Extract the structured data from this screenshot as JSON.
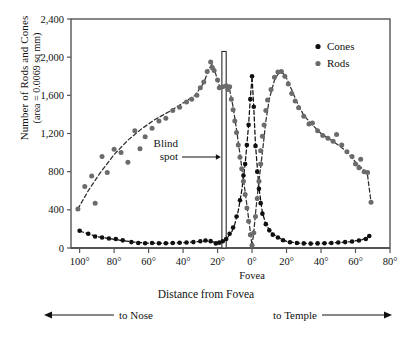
{
  "chart_data": {
    "type": "scatter",
    "title": "",
    "xlabel": "Distance from Fovea",
    "ylabel_line1": "Number of Rods and Cones",
    "ylabel_line2": "(area = 0.0069 sq mm)",
    "xlim": [
      -105,
      80
    ],
    "ylim": [
      0,
      2400
    ],
    "grid": false,
    "legend_position": "top-right",
    "x_ticks": [
      {
        "value": -100,
        "label": "100°"
      },
      {
        "value": -80,
        "label": "80°"
      },
      {
        "value": -60,
        "label": "60°"
      },
      {
        "value": -40,
        "label": "40°"
      },
      {
        "value": -20,
        "label": "20°"
      },
      {
        "value": 0,
        "label": "0°"
      },
      {
        "value": 20,
        "label": "20°"
      },
      {
        "value": 40,
        "label": "40°"
      },
      {
        "value": 60,
        "label": "60°"
      },
      {
        "value": 80,
        "label": "80°"
      }
    ],
    "y_ticks": [
      {
        "value": 0,
        "label": "0"
      },
      {
        "value": 400,
        "label": "400"
      },
      {
        "value": 800,
        "label": "800"
      },
      {
        "value": 1200,
        "label": "1,200"
      },
      {
        "value": 1600,
        "label": "1,600"
      },
      {
        "value": 2000,
        "label": "2,000"
      },
      {
        "value": 2400,
        "label": "2,400"
      }
    ],
    "fovea_tick_label": "Fovea",
    "annotations": [
      {
        "name": "blind-spot",
        "text_line1": "Blind",
        "text_line2": "spot",
        "points_to_x": -16,
        "arrow": "right"
      },
      {
        "name": "to-nose",
        "text": "to Nose",
        "arrow": "left"
      },
      {
        "name": "to-temple",
        "text": "to Temple",
        "arrow": "right"
      }
    ],
    "blind_spot_band": {
      "x_start": -17.5,
      "x_end": -15.0,
      "y_top": 2060,
      "label": "Blind spot"
    },
    "series": [
      {
        "name": "Cones",
        "color": "#101010",
        "marker": "circle",
        "points": [
          [
            -100,
            180
          ],
          [
            -95,
            150
          ],
          [
            -91,
            120
          ],
          [
            -87,
            110
          ],
          [
            -83,
            100
          ],
          [
            -79,
            95
          ],
          [
            -75,
            80
          ],
          [
            -70,
            62
          ],
          [
            -66,
            52
          ],
          [
            -62,
            50
          ],
          [
            -58,
            52
          ],
          [
            -54,
            50
          ],
          [
            -50,
            50
          ],
          [
            -46,
            52
          ],
          [
            -42,
            55
          ],
          [
            -38,
            58
          ],
          [
            -34,
            62
          ],
          [
            -30,
            70
          ],
          [
            -27,
            78
          ],
          [
            -24,
            72
          ],
          [
            -21,
            48
          ],
          [
            -19,
            56
          ],
          [
            -17,
            70
          ],
          [
            -15,
            95
          ],
          [
            -13,
            150
          ],
          [
            -11,
            215
          ],
          [
            -9,
            330
          ],
          [
            -7,
            500
          ],
          [
            -5,
            760
          ],
          [
            -4,
            880
          ],
          [
            -3,
            1080
          ],
          [
            -2,
            1290
          ],
          [
            -1,
            1560
          ],
          [
            0,
            1800
          ],
          [
            1,
            1480
          ],
          [
            2,
            1070
          ],
          [
            3,
            800
          ],
          [
            4,
            620
          ],
          [
            5,
            470
          ],
          [
            6,
            360
          ],
          [
            8,
            250
          ],
          [
            10,
            185
          ],
          [
            12,
            140
          ],
          [
            15,
            110
          ],
          [
            18,
            82
          ],
          [
            22,
            60
          ],
          [
            26,
            52
          ],
          [
            30,
            48
          ],
          [
            34,
            46
          ],
          [
            38,
            48
          ],
          [
            42,
            50
          ],
          [
            46,
            52
          ],
          [
            50,
            58
          ],
          [
            54,
            62
          ],
          [
            58,
            68
          ],
          [
            62,
            78
          ],
          [
            66,
            95
          ],
          [
            68,
            125
          ]
        ]
      },
      {
        "name": "Rods",
        "color": "#6b6b6b",
        "marker": "circle",
        "points": [
          [
            -101,
            410
          ],
          [
            -97,
            645
          ],
          [
            -93,
            755
          ],
          [
            -91,
            470
          ],
          [
            -87,
            960
          ],
          [
            -84,
            790
          ],
          [
            -80,
            1035
          ],
          [
            -76,
            1000
          ],
          [
            -72,
            900
          ],
          [
            -68,
            1230
          ],
          [
            -65,
            1040
          ],
          [
            -62,
            1165
          ],
          [
            -58,
            1255
          ],
          [
            -54,
            1330
          ],
          [
            -50,
            1360
          ],
          [
            -46,
            1440
          ],
          [
            -42,
            1475
          ],
          [
            -38,
            1530
          ],
          [
            -35,
            1560
          ],
          [
            -32,
            1600
          ],
          [
            -30,
            1680
          ],
          [
            -28,
            1740
          ],
          [
            -26,
            1850
          ],
          [
            -24,
            1950
          ],
          [
            -23,
            1890
          ],
          [
            -22,
            1860
          ],
          [
            -20,
            1760
          ],
          [
            -19,
            1680
          ],
          [
            -17,
            1690
          ],
          [
            -15,
            1700
          ],
          [
            -14,
            1660
          ],
          [
            -13,
            1690
          ],
          [
            -12,
            1560
          ],
          [
            -11,
            1450
          ],
          [
            -10,
            1330
          ],
          [
            -9,
            1210
          ],
          [
            -8,
            1080
          ],
          [
            -7,
            950
          ],
          [
            -6,
            830
          ],
          [
            -5,
            700
          ],
          [
            -4,
            560
          ],
          [
            -3,
            420
          ],
          [
            -2,
            280
          ],
          [
            -1,
            140
          ],
          [
            0,
            30
          ],
          [
            1,
            160
          ],
          [
            2,
            330
          ],
          [
            3,
            520
          ],
          [
            4,
            700
          ],
          [
            5,
            880
          ],
          [
            5,
            1020
          ],
          [
            6,
            1170
          ],
          [
            7,
            1290
          ],
          [
            8,
            1440
          ],
          [
            9,
            1550
          ],
          [
            11,
            1660
          ],
          [
            13,
            1790
          ],
          [
            15,
            1845
          ],
          [
            17,
            1850
          ],
          [
            19,
            1800
          ],
          [
            21,
            1720
          ],
          [
            23,
            1620
          ],
          [
            25,
            1540
          ],
          [
            27,
            1470
          ],
          [
            30,
            1380
          ],
          [
            33,
            1300
          ],
          [
            35,
            1310
          ],
          [
            38,
            1230
          ],
          [
            41,
            1180
          ],
          [
            44,
            1150
          ],
          [
            47,
            1120
          ],
          [
            49,
            1190
          ],
          [
            52,
            1080
          ],
          [
            55,
            1010
          ],
          [
            58,
            960
          ],
          [
            60,
            880
          ],
          [
            62,
            840
          ],
          [
            63,
            930
          ],
          [
            65,
            800
          ],
          [
            67,
            790
          ],
          [
            69,
            480
          ]
        ]
      }
    ],
    "cone_curve": [
      [
        -100,
        178
      ],
      [
        -90,
        120
      ],
      [
        -80,
        90
      ],
      [
        -70,
        64
      ],
      [
        -60,
        50
      ],
      [
        -50,
        50
      ],
      [
        -40,
        55
      ],
      [
        -32,
        66
      ],
      [
        -26,
        75
      ],
      [
        -22,
        62
      ],
      [
        -18,
        60
      ],
      [
        -15,
        92
      ],
      [
        -12,
        160
      ],
      [
        -10,
        250
      ],
      [
        -8,
        390
      ],
      [
        -6,
        600
      ],
      [
        -4,
        880
      ],
      [
        -2,
        1290
      ],
      [
        -1,
        1570
      ],
      [
        0,
        1800
      ],
      [
        1,
        1470
      ],
      [
        2,
        1080
      ],
      [
        4,
        630
      ],
      [
        6,
        370
      ],
      [
        8,
        250
      ],
      [
        11,
        165
      ],
      [
        15,
        110
      ],
      [
        20,
        70
      ],
      [
        26,
        52
      ],
      [
        34,
        46
      ],
      [
        42,
        50
      ],
      [
        50,
        57
      ],
      [
        58,
        68
      ],
      [
        64,
        88
      ],
      [
        68,
        125
      ]
    ],
    "rod_curve_left": [
      [
        -101,
        410
      ],
      [
        -95,
        600
      ],
      [
        -88,
        790
      ],
      [
        -80,
        980
      ],
      [
        -72,
        1130
      ],
      [
        -64,
        1250
      ],
      [
        -56,
        1350
      ],
      [
        -48,
        1430
      ],
      [
        -40,
        1520
      ],
      [
        -33,
        1600
      ],
      [
        -28,
        1730
      ],
      [
        -25,
        1880
      ],
      [
        -23,
        1930
      ],
      [
        -21,
        1820
      ],
      [
        -19,
        1700
      ],
      [
        -17,
        1690
      ],
      [
        -15,
        1700
      ],
      [
        -13,
        1660
      ],
      [
        -11,
        1480
      ],
      [
        -9,
        1240
      ],
      [
        -7,
        980
      ],
      [
        -5,
        720
      ],
      [
        -3,
        450
      ],
      [
        -1,
        170
      ],
      [
        0,
        20
      ]
    ],
    "rod_curve_right": [
      [
        0,
        20
      ],
      [
        1,
        170
      ],
      [
        2,
        360
      ],
      [
        3,
        540
      ],
      [
        4,
        700
      ],
      [
        6,
        1000
      ],
      [
        8,
        1330
      ],
      [
        10,
        1560
      ],
      [
        13,
        1760
      ],
      [
        16,
        1850
      ],
      [
        19,
        1820
      ],
      [
        22,
        1700
      ],
      [
        26,
        1530
      ],
      [
        30,
        1390
      ],
      [
        35,
        1290
      ],
      [
        40,
        1200
      ],
      [
        45,
        1140
      ],
      [
        50,
        1080
      ],
      [
        55,
        1010
      ],
      [
        60,
        900
      ],
      [
        64,
        830
      ],
      [
        67,
        760
      ],
      [
        69,
        480
      ]
    ]
  },
  "legend": {
    "items": [
      {
        "label": "Cones",
        "color": "#101010"
      },
      {
        "label": "Rods",
        "color": "#6b6b6b"
      }
    ]
  },
  "axes": {
    "y_title_line1": "Number of Rods and Cones",
    "y_title_line2": "(area = 0.0069 sq mm)",
    "x_title": "Distance from Fovea",
    "fovea_label": "Fovea"
  },
  "directions": {
    "nose": "to Nose",
    "temple": "to Temple"
  },
  "blind_spot": {
    "line1": "Blind",
    "line2": "spot"
  },
  "colors": {
    "cones": "#101010",
    "rods": "#6b6b6b",
    "axis": "#555555",
    "text": "#111111"
  }
}
